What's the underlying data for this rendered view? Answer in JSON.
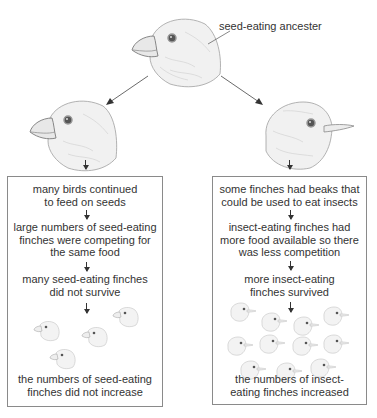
{
  "title_label": "seed-eating ancester",
  "birds": {
    "ancestor": {
      "beak": "thick-seed-beak"
    },
    "left": {
      "beak": "thick-seed-beak"
    },
    "right": {
      "beak": "thin-insect-beak"
    }
  },
  "left_branch": {
    "steps": [
      "many birds continued to feed on seeds",
      "large numbers of seed-eating finches were competing for the same food",
      "many seed-eating finches did not survive"
    ],
    "step_lines": [
      [
        "many birds continued",
        "to feed on seeds"
      ],
      [
        "large numbers of seed-eating",
        "finches were competing for",
        "the same food"
      ],
      [
        "many seed-eating finches",
        "did not survive"
      ]
    ],
    "population_count": 4,
    "outcome": "the numbers of seed-eating finches did not increase",
    "outcome_lines": [
      "the numbers of seed-eating",
      "finches did not increase"
    ]
  },
  "right_branch": {
    "steps": [
      "some finches had beaks that could be used to eat insects",
      "insect-eating finches had more food available so there was less competition",
      "more insect-eating finches survived"
    ],
    "step_lines": [
      [
        "some finches had beaks that",
        "could be used to eat insects"
      ],
      [
        "insect-eating finches had",
        "more food available so there",
        "was less competition"
      ],
      [
        "more insect-eating",
        "finches survived"
      ]
    ],
    "population_count": 11,
    "outcome": "the numbers of insect-eating finches increased",
    "outcome_lines": [
      "the numbers of insect-",
      "eating finches increased"
    ]
  },
  "colors": {
    "text": "#333333",
    "box_border": "#8a8a8a",
    "sketch": "#9a9a9a"
  }
}
